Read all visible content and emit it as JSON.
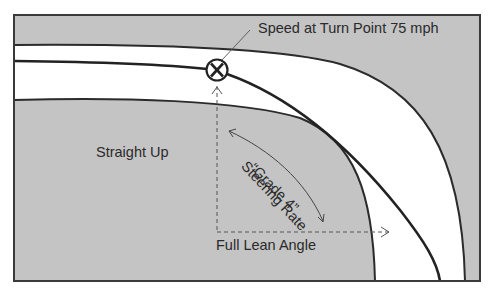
{
  "diagram": {
    "labels": {
      "turn_point": "Speed at Turn Point 75 mph",
      "straight_up": "Straight Up",
      "steering_rate": "Steering Rate",
      "grade": "“Grade 4”",
      "full_lean": "Full Lean Angle"
    },
    "colors": {
      "ground": "#c4c4c4",
      "road": "#ffffff",
      "line": "#2b2b2b",
      "frame": "#3a3a3a"
    },
    "markers": [
      {
        "name": "turn-point",
        "symbol": "X"
      }
    ]
  }
}
